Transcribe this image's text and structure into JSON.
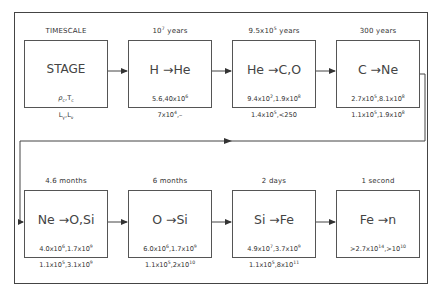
{
  "diagram": {
    "legend": {
      "timescale_label": "TIMESCALE",
      "stage_label": "STAGE",
      "line1_label": "ρc,Tc",
      "line2_label": "Lγ,Lν"
    },
    "stages": [
      {
        "timescale_html": "10<sup>7</sup> years",
        "reaction": "H →He",
        "rho_T_html": "5.6,40x10<sup>6</sup>",
        "L_html": "7x10<sup>4</sup>,–"
      },
      {
        "timescale_html": "9.5x10<sup>5</sup> years",
        "reaction": "He →C,O",
        "rho_T_html": "9.4x10<sup>2</sup>,1.9x10<sup>8</sup>",
        "L_html": "1.4x10<sup>5</sup>,&lt;250"
      },
      {
        "timescale_html": "300 years",
        "reaction": "C →Ne",
        "rho_T_html": "2.7x10<sup>5</sup>,8.1x10<sup>8</sup>",
        "L_html": "1.1x10<sup>5</sup>,1.9x10<sup>8</sup>"
      },
      {
        "timescale_html": "4.6 months",
        "reaction": "Ne →O,Si",
        "rho_T_html": "4.0x10<sup>6</sup>,1.7x10<sup>9</sup>",
        "L_html": "1.1x10<sup>5</sup>,3.1x10<sup>9</sup>"
      },
      {
        "timescale_html": "6 months",
        "reaction": "O →Si",
        "rho_T_html": "6.0x10<sup>6</sup>,1.7x10<sup>9</sup>",
        "L_html": "1.1x10<sup>5</sup>,2x10<sup>10</sup>"
      },
      {
        "timescale_html": "2 days",
        "reaction": "Si →Fe",
        "rho_T_html": "4.9x10<sup>7</sup>,3.7x10<sup>9</sup>",
        "L_html": "1.1x10<sup>5</sup>,8x10<sup>11</sup>"
      },
      {
        "timescale_html": "1 second",
        "reaction": "Fe →n",
        "rho_T_html": "&gt;2.7x10<sup>14</sup>,&gt;10<sup>10</sup>",
        "L_html": ""
      }
    ],
    "colors": {
      "line": "#444444",
      "text": "#333333",
      "background": "#ffffff"
    }
  }
}
